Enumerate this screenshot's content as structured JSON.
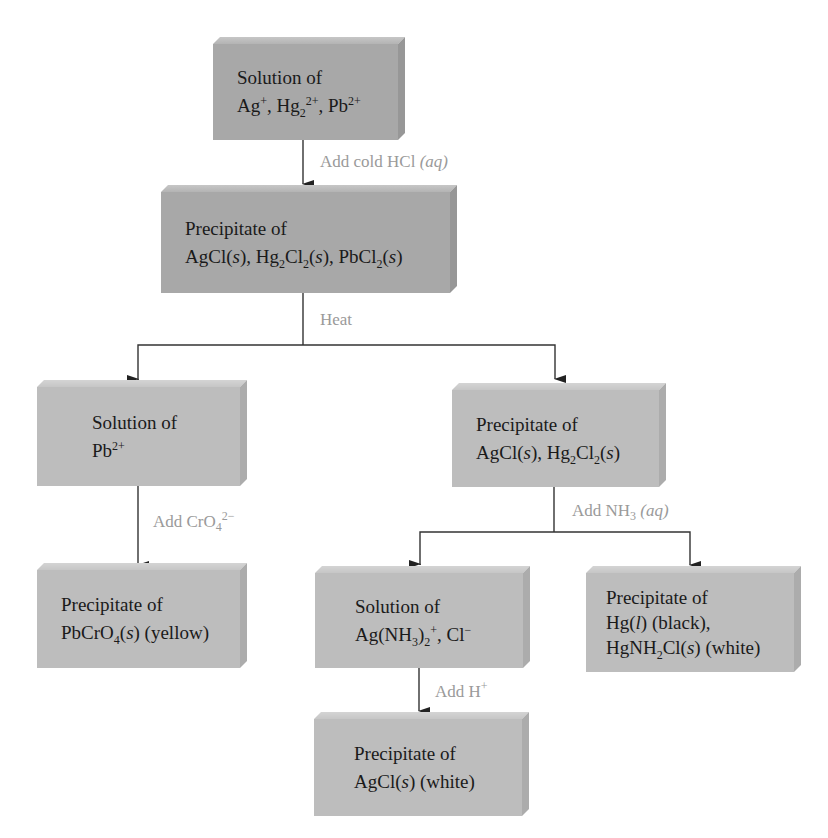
{
  "colors": {
    "box_dark": "#a8a8a8",
    "box_light": "#bdbdbd",
    "arrow": "#222222",
    "reagent_label": "#9a9a9a"
  },
  "nodes": {
    "start": {
      "line1": "Solution of",
      "line2": "Ag⁺, Hg₂²⁺, Pb²⁺"
    },
    "group_precip": {
      "line1": "Precipitate of",
      "line2": "AgCl(s), Hg₂Cl₂(s), PbCl₂(s)"
    },
    "pb_solution": {
      "line1": "Solution of",
      "line2": "Pb²⁺"
    },
    "ag_hg_precip": {
      "line1": "Precipitate of",
      "line2": "AgCl(s), Hg₂Cl₂(s)"
    },
    "pbcro4_precip": {
      "line1": "Precipitate of",
      "line2": "PbCrO₄(s) (yellow)"
    },
    "ag_nh3_solution": {
      "line1": "Solution of",
      "line2": "Ag(NH₃)₂⁺, Cl⁻"
    },
    "hg_precip": {
      "line1": "Precipitate of",
      "line2": "Hg(l) (black),",
      "line3": "HgNH₂Cl(s) (white)"
    },
    "agcl_precip": {
      "line1": "Precipitate of",
      "line2": "AgCl(s) (white)"
    }
  },
  "edges": {
    "add_hcl": "Add cold HCl (aq)",
    "heat": "Heat",
    "add_cro4": "Add CrO₄²⁻",
    "add_nh3": "Add NH₃ (aq)",
    "add_h": "Add H⁺"
  }
}
